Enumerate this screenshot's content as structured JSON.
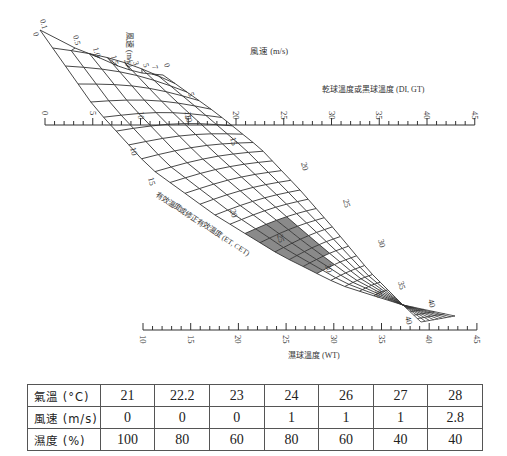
{
  "chart_data": {
    "type": "nomogram",
    "title": "",
    "axes": {
      "wind_speed": {
        "label": "風速 (m/s)",
        "label_rotated": "風速 (m/s)",
        "ticks": [
          "0.1",
          "0.5",
          "1.0",
          "1.5",
          "2",
          "3",
          "5",
          "7"
        ],
        "zero_label": "0",
        "end_label": "0"
      },
      "dry_bulb": {
        "label": "乾球溫度或黑球溫度 (DI, GT)",
        "ticks": [
          0,
          5,
          10,
          15,
          20,
          25,
          30,
          35,
          40,
          45
        ],
        "range": [
          0,
          45
        ]
      },
      "effective_temperature": {
        "label": "有效溫度或修正有效溫度 (ET, CET)",
        "ticks_upper": [
          5,
          10,
          15,
          20,
          25,
          30,
          35,
          40
        ],
        "ticks_lower": [
          10,
          15,
          20,
          25,
          30,
          35,
          40
        ]
      },
      "wet_bulb": {
        "label": "濕球溫度 (WT)",
        "ticks": [
          10,
          15,
          20,
          25,
          30,
          35,
          40,
          45
        ],
        "range": [
          10,
          45
        ]
      }
    },
    "highlight": {
      "description": "shaded comfort zone on effective temperature grid",
      "et_range": [
        22,
        25
      ],
      "color": "#8a8a8a"
    },
    "grid": true
  },
  "table": {
    "rows": [
      {
        "label": "氣溫 (°C)",
        "values": [
          "21",
          "22.2",
          "23",
          "24",
          "26",
          "27",
          "28"
        ]
      },
      {
        "label": "風速 (m/s)",
        "values": [
          "0",
          "0",
          "0",
          "1",
          "1",
          "1",
          "2.8"
        ]
      },
      {
        "label": "濕度 (%)",
        "values": [
          "100",
          "80",
          "60",
          "80",
          "60",
          "40",
          "40"
        ]
      }
    ]
  },
  "colors": {
    "line": "#333333",
    "shade": "#8a8a8a",
    "table_border": "#555555"
  }
}
